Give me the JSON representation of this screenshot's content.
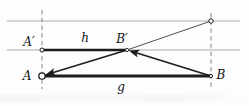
{
  "figure": {
    "width": 249,
    "height": 106,
    "background": "#fdfdfd",
    "colors": {
      "parallel_line": "#aeaeae",
      "dashed_line": "#858585",
      "ink": "#1d1d1d",
      "thin_ink": "#3a3a3a",
      "label": "#141414"
    },
    "parallel_lines": [
      {
        "name": "top-parallel-line",
        "x1": 7,
        "y1": 21,
        "x2": 240,
        "y2": 21,
        "width": 1.2
      },
      {
        "name": "middle-parallel-line",
        "x1": 7,
        "y1": 50,
        "x2": 240,
        "y2": 50,
        "width": 1.2
      }
    ],
    "dashed_lines": [
      {
        "name": "dashed-vertical-through-A",
        "x1": 42,
        "y1": 10,
        "x2": 42,
        "y2": 89,
        "width": 1,
        "dash": "4.5 3.2"
      },
      {
        "name": "dashed-vertical-through-B",
        "x1": 211,
        "y1": 13,
        "x2": 211,
        "y2": 89,
        "width": 1,
        "dash": "4.5 3.2"
      }
    ],
    "thin_segments": [
      {
        "name": "ray-Bprime-to-top-point",
        "x1": 127,
        "y1": 50,
        "x2": 211,
        "y2": 21,
        "width": 0.9
      }
    ],
    "thick_segments": [
      {
        "name": "segment-h",
        "x1": 42,
        "y1": 50,
        "x2": 127,
        "y2": 50,
        "width": 2.6
      },
      {
        "name": "segment-g",
        "x1": 42,
        "y1": 76,
        "x2": 211,
        "y2": 76,
        "width": 2.8
      }
    ],
    "arrows": [
      {
        "name": "arrow-B-to-Bprime",
        "x1": 211,
        "y1": 76,
        "x2": 128.7,
        "y2": 50.5,
        "width": 1.6
      },
      {
        "name": "arrow-Bprime-to-A",
        "x1": 127,
        "y1": 50,
        "x2": 45.1,
        "y2": 75.1,
        "width": 1.6
      }
    ],
    "points": [
      {
        "name": "point-A",
        "x": 42,
        "y": 76,
        "r": 3.2,
        "stroke": 1.3
      },
      {
        "name": "point-B",
        "x": 211,
        "y": 76,
        "r": 1.6,
        "stroke": 1.0
      },
      {
        "name": "point-A-prime",
        "x": 42,
        "y": 50,
        "r": 2.0,
        "stroke": 1.0
      },
      {
        "name": "point-B-prime",
        "x": 127,
        "y": 50,
        "r": 1.6,
        "stroke": 0.9
      },
      {
        "name": "point-top-right",
        "x": 211,
        "y": 21,
        "r": 2.2,
        "stroke": 1.0
      }
    ],
    "labels": [
      {
        "name": "label-A-prime",
        "text": "A′",
        "x": 29,
        "y": 46,
        "size": 12
      },
      {
        "name": "label-h",
        "text": "h",
        "x": 85,
        "y": 42,
        "size": 12
      },
      {
        "name": "label-B-prime",
        "text": "B′",
        "x": 122,
        "y": 43,
        "size": 12
      },
      {
        "name": "label-A",
        "text": "A",
        "x": 27,
        "y": 80,
        "size": 12
      },
      {
        "name": "label-g",
        "text": "g",
        "x": 121,
        "y": 91,
        "size": 12
      },
      {
        "name": "label-B",
        "text": "B",
        "x": 221,
        "y": 79,
        "size": 12
      }
    ]
  }
}
